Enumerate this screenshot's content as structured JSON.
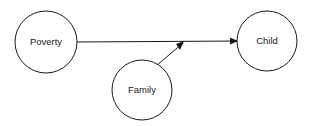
{
  "diagram": {
    "background_color": "#ffffff",
    "stroke_color": "#1a1a1a",
    "text_color": "#1a1a1a",
    "nodes": [
      {
        "id": "poverty",
        "label": "Poverty",
        "shape": "circle",
        "cx": 46,
        "cy": 42,
        "r": 31
      },
      {
        "id": "family",
        "label": "Family",
        "shape": "circle",
        "cx": 142,
        "cy": 90,
        "r": 30
      },
      {
        "id": "child",
        "label": "Child",
        "shape": "circle",
        "cx": 267,
        "cy": 41,
        "r": 30
      }
    ],
    "edges": [
      {
        "id": "poverty-to-child",
        "from": "poverty",
        "to": "child",
        "style": "straight-arrow",
        "label": "",
        "x1": 77,
        "y1": 42,
        "x2": 237,
        "y2": 41
      },
      {
        "id": "family-to-edge",
        "from": "family",
        "to": "poverty-to-child",
        "style": "straight-arrow",
        "label": "",
        "x1": 156,
        "y1": 66,
        "x2": 182,
        "y2": 43
      }
    ],
    "arrowheads": [
      {
        "id": "arrowhead-into-child",
        "x": 237,
        "y": 41,
        "angle": 0
      },
      {
        "id": "arrowhead-onto-main-path",
        "x": 182,
        "y": 43,
        "angle": -41
      }
    ]
  }
}
